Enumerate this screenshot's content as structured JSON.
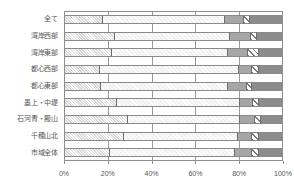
{
  "chart_data": {
    "type": "bar",
    "orientation": "horizontal",
    "stacked": true,
    "normalized": "100%",
    "title": "",
    "xlabel": "",
    "ylabel": "",
    "xlim": [
      0,
      100
    ],
    "grid": true,
    "legend_position": "none",
    "xticks": [
      "0%",
      "20%",
      "40%",
      "60%",
      "80%",
      "100%"
    ],
    "xtick_values": [
      0,
      20,
      40,
      60,
      80,
      100
    ],
    "categories": [
      "全て",
      "湾岸西部",
      "湾岸東部",
      "都心西部",
      "都心東部",
      "墨上・中堤",
      "石河青・殿山",
      "千穂山北",
      "市域全体"
    ],
    "series": [
      {
        "name": "系列1",
        "values": [
          18.0,
          23.5,
          22.0,
          16.5,
          17.0,
          24.0,
          29.0,
          27.5,
          21.0
        ]
      },
      {
        "name": "系列2",
        "values": [
          55.5,
          52.5,
          53.0,
          63.5,
          58.0,
          56.5,
          51.5,
          52.0,
          57.0
        ]
      },
      {
        "name": "系列3",
        "values": [
          8.5,
          9.5,
          9.0,
          6.0,
          8.5,
          6.0,
          6.5,
          6.5,
          8.0
        ]
      },
      {
        "name": "系列4",
        "values": [
          3.0,
          2.5,
          5.0,
          3.0,
          2.5,
          2.5,
          3.0,
          3.0,
          3.0
        ]
      },
      {
        "name": "系列5",
        "values": [
          15.0,
          12.0,
          11.0,
          11.0,
          14.0,
          11.0,
          10.0,
          11.0,
          11.0
        ]
      }
    ],
    "colors": {
      "series1": "#d9d9d9",
      "series2": "#f2f2f2",
      "series3": "#a6a6a6",
      "series4": "#ffffff",
      "series5": "#8c8c8c",
      "axis": "#8f8f8f",
      "grid": "#9a9a9a",
      "text": "#555555"
    }
  }
}
